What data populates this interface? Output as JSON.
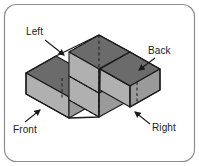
{
  "figure": {
    "frame": {
      "border_color": "#8c8c8c",
      "background": "#ffffff",
      "corner_radius": 12
    },
    "labels": [
      {
        "id": "left",
        "text": "Left",
        "arrow_direction": "down-right"
      },
      {
        "id": "back",
        "text": "Back",
        "arrow_direction": "down-left"
      },
      {
        "id": "front",
        "text": "Front",
        "arrow_direction": "up-right"
      },
      {
        "id": "right",
        "text": "Right",
        "arrow_direction": "up-left"
      }
    ],
    "colors": {
      "top_face": "#6b6b6b",
      "left_face": "#b0b0b0",
      "right_face": "#9a9a9a",
      "outline": "#1a1a1a",
      "hidden_edge": "#1a1a1a",
      "label_text": "#1a1a1a"
    },
    "geometry": {
      "projection": "isometric",
      "unit_half_width": 21,
      "unit_half_depth": 12,
      "unit_height": 24,
      "description": "Plus/T shaped stack of unit cubes: a two-high central tower with single-cube arms extending left-front and right-back at the base level.",
      "hidden_edges_style": "dashed"
    }
  }
}
